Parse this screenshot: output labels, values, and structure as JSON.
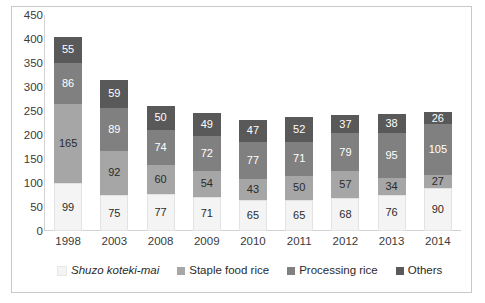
{
  "chart_data": {
    "type": "bar",
    "stacked": true,
    "orientation": "vertical",
    "title": "",
    "subtitle": "",
    "xlabel": "",
    "ylabel": "",
    "ylim": [
      0,
      450
    ],
    "ytick_step": 50,
    "yticks": [
      450,
      400,
      350,
      300,
      250,
      200,
      150,
      100,
      50,
      0
    ],
    "grid": false,
    "legend_position": "bottom",
    "categories": [
      "1998",
      "2003",
      "2008",
      "2009",
      "2010",
      "2011",
      "2012",
      "2013",
      "2014"
    ],
    "series": [
      {
        "name": "Shuzo koteki-mai",
        "color": "#f4f4f4",
        "italic": true,
        "values": [
          99,
          75,
          77,
          71,
          65,
          65,
          68,
          76,
          90
        ]
      },
      {
        "name": "Staple food rice",
        "color": "#a6a6a6",
        "italic": false,
        "values": [
          165,
          92,
          60,
          54,
          43,
          50,
          57,
          34,
          27
        ]
      },
      {
        "name": "Processing rice",
        "color": "#808080",
        "italic": false,
        "values": [
          86,
          89,
          74,
          72,
          77,
          71,
          79,
          95,
          105
        ]
      },
      {
        "name": "Others",
        "color": "#595959",
        "italic": false,
        "values": [
          55,
          59,
          50,
          49,
          47,
          52,
          37,
          38,
          26
        ]
      }
    ],
    "totals": [
      405,
      315,
      261,
      246,
      232,
      238,
      241,
      243,
      248
    ]
  }
}
